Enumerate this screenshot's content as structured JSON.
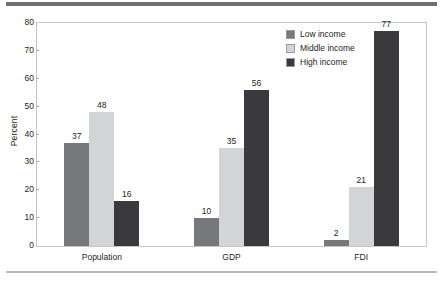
{
  "chart_data": {
    "type": "bar",
    "title": "",
    "xlabel": "",
    "ylabel": "Percent",
    "ylim": [
      0,
      80
    ],
    "yticks": [
      0,
      10,
      20,
      30,
      40,
      50,
      60,
      70,
      80
    ],
    "grid": false,
    "legend_position": "top-right inside plot",
    "categories": [
      "Population",
      "GDP",
      "FDI"
    ],
    "series": [
      {
        "name": "Low income",
        "color": "#77787a",
        "values": [
          37,
          10,
          2
        ]
      },
      {
        "name": "Middle income",
        "color": "#d3d4d5",
        "values": [
          48,
          35,
          21
        ]
      },
      {
        "name": "High income",
        "color": "#3a3a3c",
        "values": [
          16,
          56,
          77
        ]
      }
    ]
  },
  "axis": {
    "y_title": "Percent",
    "tick_labels": [
      "0",
      "10",
      "20",
      "30",
      "40",
      "50",
      "60",
      "70",
      "80"
    ],
    "category_labels": [
      "Population",
      "GDP",
      "FDI"
    ]
  },
  "legend": {
    "items": [
      {
        "label": "Low income",
        "color": "#77787a"
      },
      {
        "label": "Middle income",
        "color": "#d3d4d5"
      },
      {
        "label": "High income",
        "color": "#3a3a3c"
      }
    ]
  },
  "value_labels": {
    "population": [
      "37",
      "48",
      "16"
    ],
    "gdp": [
      "10",
      "35",
      "56"
    ],
    "fdi": [
      "2",
      "21",
      "77"
    ]
  },
  "rules": {
    "top_color": "#6e6f71",
    "bottom_color": "#b9babb"
  }
}
